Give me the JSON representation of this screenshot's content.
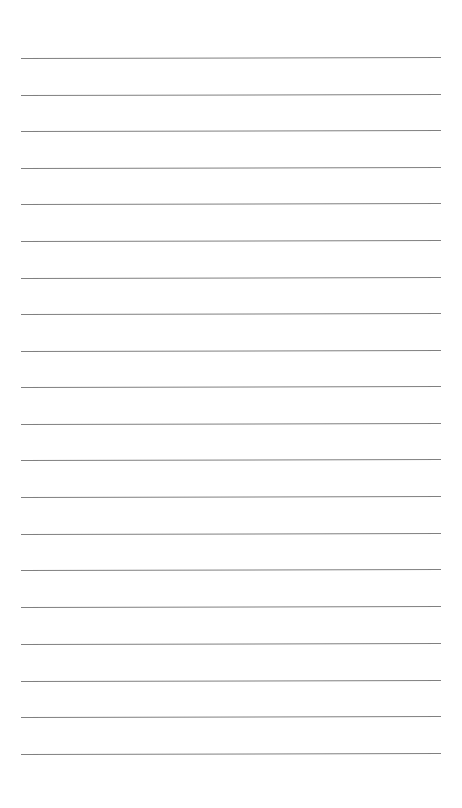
{
  "page": {
    "type": "lined-paper",
    "background_color": "#ffffff",
    "line_color": "#808080",
    "line_count": 20,
    "line_left": 21,
    "line_width": 420,
    "line_positions_y": [
      58,
      95,
      131,
      168,
      204,
      241,
      278,
      314,
      351,
      387,
      424,
      460,
      497,
      534,
      570,
      607,
      644,
      681,
      717,
      754
    ]
  }
}
